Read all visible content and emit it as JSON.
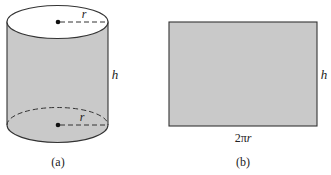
{
  "figure_a": {
    "caption": "(a)",
    "radius_label_top": "r",
    "radius_label_bottom": "r",
    "height_label": "h",
    "shape": "cylinder"
  },
  "figure_b": {
    "caption": "(b)",
    "width_label": "2πr",
    "width_label_num": "2π",
    "width_label_var": "r",
    "height_label": "h",
    "shape": "rectangle"
  },
  "colors": {
    "fill": "#c9c9c9",
    "stroke": "#333333",
    "background": "#ffffff"
  }
}
